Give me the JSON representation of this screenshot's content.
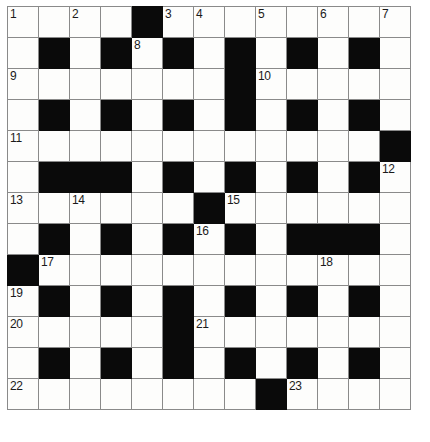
{
  "puzzle": {
    "title": "Crossword Grid",
    "type": "crossword",
    "columns": 13,
    "rows": 13,
    "colors": {
      "block": "#0a0a0a",
      "cell": "#fdfdfc",
      "grid_line": "#8a8a8a",
      "outer_border": "#4a4a4a",
      "number_text": "#1a1a1a"
    },
    "clue_numbers": [
      1,
      2,
      3,
      4,
      5,
      6,
      7,
      8,
      9,
      10,
      11,
      12,
      13,
      14,
      15,
      16,
      17,
      18,
      19,
      20,
      21,
      22,
      23
    ],
    "grid": [
      [
        {
          "black": false,
          "number": "1"
        },
        {
          "black": false,
          "number": ""
        },
        {
          "black": false,
          "number": "2"
        },
        {
          "black": false,
          "number": ""
        },
        {
          "black": true,
          "number": ""
        },
        {
          "black": false,
          "number": "3"
        },
        {
          "black": false,
          "number": "4"
        },
        {
          "black": false,
          "number": ""
        },
        {
          "black": false,
          "number": "5"
        },
        {
          "black": false,
          "number": ""
        },
        {
          "black": false,
          "number": "6"
        },
        {
          "black": false,
          "number": ""
        },
        {
          "black": false,
          "number": "7"
        }
      ],
      [
        {
          "black": false,
          "number": ""
        },
        {
          "black": true,
          "number": ""
        },
        {
          "black": false,
          "number": ""
        },
        {
          "black": true,
          "number": ""
        },
        {
          "black": false,
          "number": "8"
        },
        {
          "black": true,
          "number": ""
        },
        {
          "black": false,
          "number": ""
        },
        {
          "black": true,
          "number": ""
        },
        {
          "black": false,
          "number": ""
        },
        {
          "black": true,
          "number": ""
        },
        {
          "black": false,
          "number": ""
        },
        {
          "black": true,
          "number": ""
        },
        {
          "black": false,
          "number": ""
        }
      ],
      [
        {
          "black": false,
          "number": "9"
        },
        {
          "black": false,
          "number": ""
        },
        {
          "black": false,
          "number": ""
        },
        {
          "black": false,
          "number": ""
        },
        {
          "black": false,
          "number": ""
        },
        {
          "black": false,
          "number": ""
        },
        {
          "black": false,
          "number": ""
        },
        {
          "black": true,
          "number": ""
        },
        {
          "black": false,
          "number": "10"
        },
        {
          "black": false,
          "number": ""
        },
        {
          "black": false,
          "number": ""
        },
        {
          "black": false,
          "number": ""
        },
        {
          "black": false,
          "number": ""
        }
      ],
      [
        {
          "black": false,
          "number": ""
        },
        {
          "black": true,
          "number": ""
        },
        {
          "black": false,
          "number": ""
        },
        {
          "black": true,
          "number": ""
        },
        {
          "black": false,
          "number": ""
        },
        {
          "black": true,
          "number": ""
        },
        {
          "black": false,
          "number": ""
        },
        {
          "black": true,
          "number": ""
        },
        {
          "black": false,
          "number": ""
        },
        {
          "black": true,
          "number": ""
        },
        {
          "black": false,
          "number": ""
        },
        {
          "black": true,
          "number": ""
        },
        {
          "black": false,
          "number": ""
        }
      ],
      [
        {
          "black": false,
          "number": "11"
        },
        {
          "black": false,
          "number": ""
        },
        {
          "black": false,
          "number": ""
        },
        {
          "black": false,
          "number": ""
        },
        {
          "black": false,
          "number": ""
        },
        {
          "black": false,
          "number": ""
        },
        {
          "black": false,
          "number": ""
        },
        {
          "black": false,
          "number": ""
        },
        {
          "black": false,
          "number": ""
        },
        {
          "black": false,
          "number": ""
        },
        {
          "black": false,
          "number": ""
        },
        {
          "black": false,
          "number": ""
        },
        {
          "black": true,
          "number": ""
        }
      ],
      [
        {
          "black": false,
          "number": ""
        },
        {
          "black": true,
          "number": ""
        },
        {
          "black": true,
          "number": ""
        },
        {
          "black": true,
          "number": ""
        },
        {
          "black": false,
          "number": ""
        },
        {
          "black": true,
          "number": ""
        },
        {
          "black": false,
          "number": ""
        },
        {
          "black": true,
          "number": ""
        },
        {
          "black": false,
          "number": ""
        },
        {
          "black": true,
          "number": ""
        },
        {
          "black": false,
          "number": ""
        },
        {
          "black": true,
          "number": ""
        },
        {
          "black": false,
          "number": "12"
        }
      ],
      [
        {
          "black": false,
          "number": "13"
        },
        {
          "black": false,
          "number": ""
        },
        {
          "black": false,
          "number": "14"
        },
        {
          "black": false,
          "number": ""
        },
        {
          "black": false,
          "number": ""
        },
        {
          "black": false,
          "number": ""
        },
        {
          "black": true,
          "number": ""
        },
        {
          "black": false,
          "number": "15"
        },
        {
          "black": false,
          "number": ""
        },
        {
          "black": false,
          "number": ""
        },
        {
          "black": false,
          "number": ""
        },
        {
          "black": false,
          "number": ""
        },
        {
          "black": false,
          "number": ""
        }
      ],
      [
        {
          "black": false,
          "number": ""
        },
        {
          "black": true,
          "number": ""
        },
        {
          "black": false,
          "number": ""
        },
        {
          "black": true,
          "number": ""
        },
        {
          "black": false,
          "number": ""
        },
        {
          "black": true,
          "number": ""
        },
        {
          "black": false,
          "number": "16"
        },
        {
          "black": true,
          "number": ""
        },
        {
          "black": false,
          "number": ""
        },
        {
          "black": true,
          "number": ""
        },
        {
          "black": true,
          "number": ""
        },
        {
          "black": true,
          "number": ""
        },
        {
          "black": false,
          "number": ""
        }
      ],
      [
        {
          "black": true,
          "number": ""
        },
        {
          "black": false,
          "number": "17"
        },
        {
          "black": false,
          "number": ""
        },
        {
          "black": false,
          "number": ""
        },
        {
          "black": false,
          "number": ""
        },
        {
          "black": false,
          "number": ""
        },
        {
          "black": false,
          "number": ""
        },
        {
          "black": false,
          "number": ""
        },
        {
          "black": false,
          "number": ""
        },
        {
          "black": false,
          "number": ""
        },
        {
          "black": false,
          "number": "18"
        },
        {
          "black": false,
          "number": ""
        },
        {
          "black": false,
          "number": ""
        }
      ],
      [
        {
          "black": false,
          "number": "19"
        },
        {
          "black": true,
          "number": ""
        },
        {
          "black": false,
          "number": ""
        },
        {
          "black": true,
          "number": ""
        },
        {
          "black": false,
          "number": ""
        },
        {
          "black": true,
          "number": ""
        },
        {
          "black": false,
          "number": ""
        },
        {
          "black": true,
          "number": ""
        },
        {
          "black": false,
          "number": ""
        },
        {
          "black": true,
          "number": ""
        },
        {
          "black": false,
          "number": ""
        },
        {
          "black": true,
          "number": ""
        },
        {
          "black": false,
          "number": ""
        }
      ],
      [
        {
          "black": false,
          "number": "20"
        },
        {
          "black": false,
          "number": ""
        },
        {
          "black": false,
          "number": ""
        },
        {
          "black": false,
          "number": ""
        },
        {
          "black": false,
          "number": ""
        },
        {
          "black": true,
          "number": ""
        },
        {
          "black": false,
          "number": "21"
        },
        {
          "black": false,
          "number": ""
        },
        {
          "black": false,
          "number": ""
        },
        {
          "black": false,
          "number": ""
        },
        {
          "black": false,
          "number": ""
        },
        {
          "black": false,
          "number": ""
        },
        {
          "black": false,
          "number": ""
        }
      ],
      [
        {
          "black": false,
          "number": ""
        },
        {
          "black": true,
          "number": ""
        },
        {
          "black": false,
          "number": ""
        },
        {
          "black": true,
          "number": ""
        },
        {
          "black": false,
          "number": ""
        },
        {
          "black": true,
          "number": ""
        },
        {
          "black": false,
          "number": ""
        },
        {
          "black": true,
          "number": ""
        },
        {
          "black": false,
          "number": ""
        },
        {
          "black": true,
          "number": ""
        },
        {
          "black": false,
          "number": ""
        },
        {
          "black": true,
          "number": ""
        },
        {
          "black": false,
          "number": ""
        }
      ],
      [
        {
          "black": false,
          "number": "22"
        },
        {
          "black": false,
          "number": ""
        },
        {
          "black": false,
          "number": ""
        },
        {
          "black": false,
          "number": ""
        },
        {
          "black": false,
          "number": ""
        },
        {
          "black": false,
          "number": ""
        },
        {
          "black": false,
          "number": ""
        },
        {
          "black": false,
          "number": ""
        },
        {
          "black": true,
          "number": ""
        },
        {
          "black": false,
          "number": "23"
        },
        {
          "black": false,
          "number": ""
        },
        {
          "black": false,
          "number": ""
        },
        {
          "black": false,
          "number": ""
        }
      ]
    ]
  }
}
